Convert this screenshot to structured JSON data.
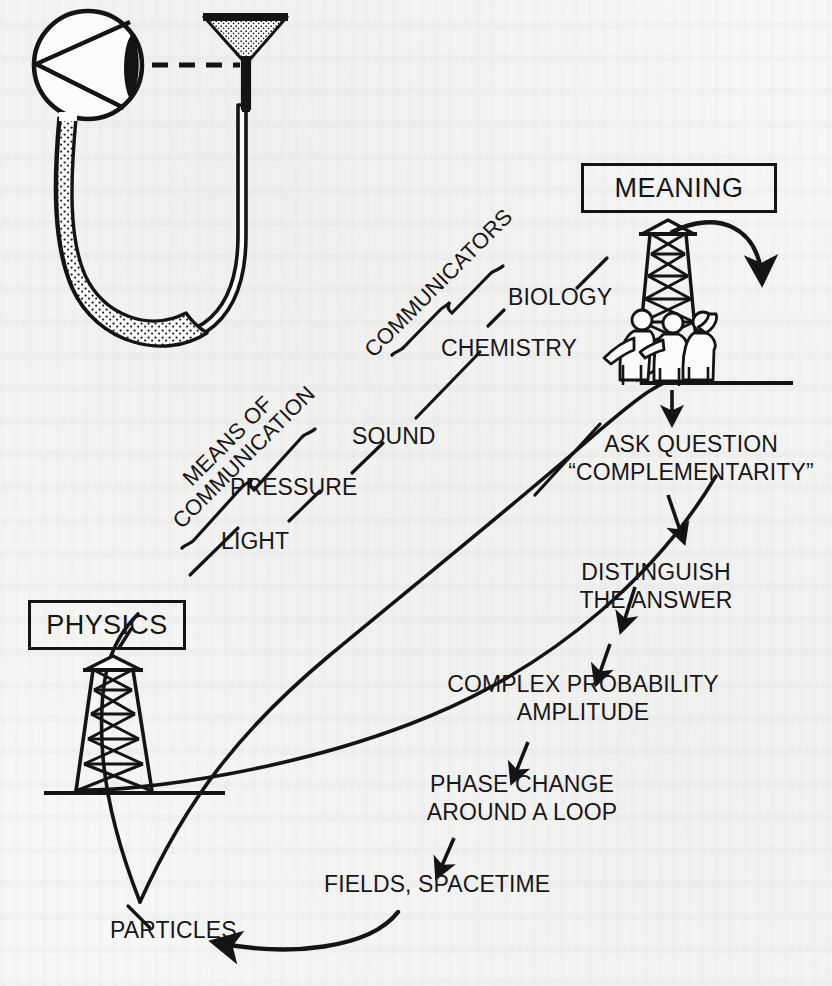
{
  "figure": {
    "ink_color": "#141417",
    "paper_color": "#f7f7f6"
  },
  "boxes": [
    {
      "id": "physics",
      "label": "PHYSICS"
    },
    {
      "id": "meaning",
      "label": "MEANING"
    }
  ],
  "brackets": [
    {
      "id": "means-of-communication",
      "line1": "MEANS OF",
      "line2": "COMMUNICATION"
    },
    {
      "id": "communicators",
      "label": "COMMUNICATORS"
    }
  ],
  "channel_labels": [
    {
      "id": "light",
      "label": "LIGHT"
    },
    {
      "id": "pressure",
      "label": "PRESSURE"
    },
    {
      "id": "sound",
      "label": "SOUND"
    },
    {
      "id": "chemistry",
      "label": "CHEMISTRY"
    },
    {
      "id": "biology",
      "label": "BIOLOGY"
    }
  ],
  "chain": [
    {
      "id": "ask-question",
      "line1": "ASK QUESTION",
      "line2": "“COMPLEMENTARITY”"
    },
    {
      "id": "distinguish-the-answer",
      "line1": "DISTINGUISH",
      "line2": "THE ANSWER"
    },
    {
      "id": "complex-probability-amplitude",
      "line1": "COMPLEX PROBABILITY",
      "line2": "AMPLITUDE"
    },
    {
      "id": "phase-change-around-a-loop",
      "line1": "PHASE CHANGE",
      "line2": "AROUND A LOOP"
    },
    {
      "id": "fields-spacetime",
      "label": "FIELDS, SPACETIME"
    },
    {
      "id": "particles",
      "label": "PARTICLES"
    }
  ],
  "icons": {
    "eye": "eye-icon",
    "u_tube": "u-tube-icon",
    "funnel": "funnel-icon",
    "sight_line": "dashed-sight-line-icon",
    "observer_tower_left": "observation-tower-icon",
    "observer_tower_right": "observation-tower-with-observers-icon",
    "feedback_arrow": "curved-feedback-arrow-icon",
    "loop_arrow": "curved-loop-arrow-icon"
  }
}
